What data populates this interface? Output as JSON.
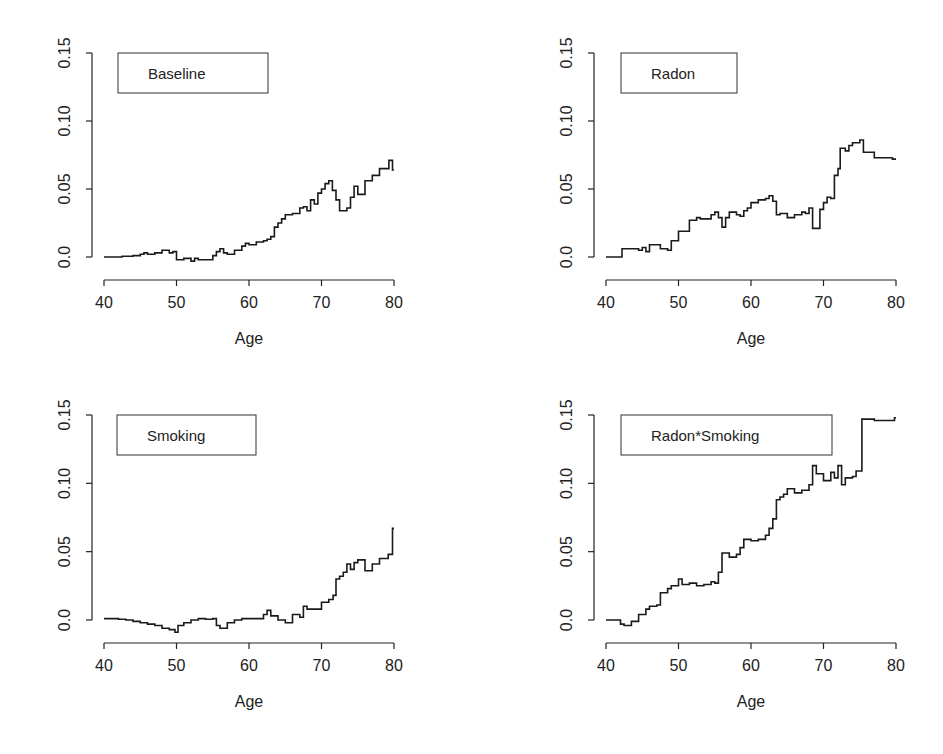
{
  "figure": {
    "panels_layout": "2x2",
    "x_label": "Age"
  },
  "chart_data": [
    {
      "type": "line",
      "step": true,
      "title": "Baseline",
      "legend": "Baseline",
      "xlabel": "Age",
      "ylabel": "",
      "xlim": [
        40,
        80
      ],
      "ylim": [
        -0.01,
        0.15
      ],
      "xticks": [
        40,
        50,
        60,
        70,
        80
      ],
      "xtick_labels": [
        "40",
        "50",
        "60",
        "70",
        "80"
      ],
      "yticks": [
        0.0,
        0.05,
        0.1,
        0.15
      ],
      "ytick_labels": [
        "0.0",
        "0.05",
        "0.10",
        "0.15"
      ],
      "grid": false,
      "legend_position": "top-left",
      "x": [
        40,
        42,
        42.5,
        44,
        45,
        45.5,
        46,
        47,
        48,
        49,
        49.5,
        50,
        50.5,
        51,
        52,
        52.5,
        53,
        54,
        55,
        55.5,
        56,
        56.5,
        57,
        58,
        59,
        59.5,
        60,
        61,
        62,
        62.5,
        63,
        63.5,
        64,
        64.5,
        65,
        66,
        67,
        67.5,
        68,
        68.5,
        69,
        69.5,
        70,
        70.5,
        71,
        71.5,
        72,
        72.5,
        73,
        73.5,
        74,
        74.5,
        75,
        76,
        77,
        78,
        79.3,
        79.8
      ],
      "y": [
        0.0,
        0.0,
        0.0005,
        0.001,
        0.002,
        0.003,
        0.002,
        0.003,
        0.005,
        0.003,
        0.004,
        -0.002,
        -0.002,
        -0.001,
        -0.003,
        -0.001,
        -0.002,
        -0.002,
        0.001,
        0.004,
        0.006,
        0.003,
        0.002,
        0.005,
        0.008,
        0.01,
        0.009,
        0.011,
        0.012,
        0.013,
        0.015,
        0.022,
        0.025,
        0.028,
        0.031,
        0.032,
        0.036,
        0.037,
        0.034,
        0.042,
        0.039,
        0.047,
        0.05,
        0.054,
        0.056,
        0.049,
        0.042,
        0.034,
        0.034,
        0.036,
        0.044,
        0.052,
        0.046,
        0.056,
        0.06,
        0.065,
        0.071,
        0.064
      ]
    },
    {
      "type": "line",
      "step": true,
      "title": "Radon",
      "legend": "Radon",
      "xlabel": "Age",
      "ylabel": "",
      "xlim": [
        40,
        80
      ],
      "ylim": [
        -0.01,
        0.15
      ],
      "xticks": [
        40,
        50,
        60,
        70,
        80
      ],
      "xtick_labels": [
        "40",
        "50",
        "60",
        "70",
        "80"
      ],
      "yticks": [
        0.0,
        0.05,
        0.1,
        0.15
      ],
      "ytick_labels": [
        "0.0",
        "0.05",
        "0.10",
        "0.15"
      ],
      "grid": false,
      "legend_position": "top-left",
      "x": [
        40,
        42.2,
        44.5,
        45,
        45.5,
        46,
        47.5,
        48.5,
        49,
        50,
        51.5,
        52.5,
        53,
        54.5,
        55,
        55.5,
        56,
        56.5,
        57,
        58,
        58.5,
        59,
        59.5,
        60,
        61,
        62,
        62.5,
        63,
        63.5,
        64,
        65,
        66,
        67,
        67.5,
        68,
        68.5,
        69,
        69.5,
        70,
        70.5,
        71,
        71.5,
        72,
        72.3,
        73,
        73.5,
        74,
        75,
        75.5,
        77,
        79.5
      ],
      "y": [
        0.0,
        0.006,
        0.005,
        0.007,
        0.004,
        0.009,
        0.006,
        0.005,
        0.012,
        0.019,
        0.027,
        0.029,
        0.028,
        0.031,
        0.033,
        0.029,
        0.022,
        0.029,
        0.033,
        0.031,
        0.03,
        0.034,
        0.036,
        0.04,
        0.042,
        0.043,
        0.045,
        0.041,
        0.031,
        0.032,
        0.029,
        0.031,
        0.033,
        0.032,
        0.036,
        0.021,
        0.021,
        0.035,
        0.04,
        0.044,
        0.043,
        0.06,
        0.065,
        0.08,
        0.078,
        0.082,
        0.084,
        0.086,
        0.077,
        0.073,
        0.072
      ]
    },
    {
      "type": "line",
      "step": true,
      "title": "Smoking",
      "legend": "Smoking",
      "xlabel": "Age",
      "ylabel": "",
      "xlim": [
        40,
        80
      ],
      "ylim": [
        -0.01,
        0.15
      ],
      "xticks": [
        40,
        50,
        60,
        70,
        80
      ],
      "xtick_labels": [
        "40",
        "50",
        "60",
        "70",
        "80"
      ],
      "yticks": [
        0.0,
        0.05,
        0.1,
        0.15
      ],
      "ytick_labels": [
        "0.0",
        "0.05",
        "0.10",
        "0.15"
      ],
      "grid": false,
      "legend_position": "top-left",
      "x": [
        40,
        42,
        43,
        44,
        45,
        46,
        47,
        48,
        49,
        49.8,
        50.2,
        51,
        52,
        53,
        54,
        55,
        55.5,
        56,
        57,
        58,
        59,
        60,
        61,
        62,
        62.5,
        63,
        64,
        65,
        66,
        67,
        67.5,
        68,
        69,
        70,
        71,
        71.6,
        72,
        72.5,
        73,
        73.5,
        74,
        74.5,
        75,
        76,
        77,
        78,
        79.2,
        79.8
      ],
      "y": [
        0.001,
        0.0005,
        0.0,
        -0.001,
        -0.002,
        -0.003,
        -0.004,
        -0.006,
        -0.007,
        -0.009,
        -0.004,
        -0.002,
        0.0,
        0.001,
        0.0005,
        0.001,
        -0.004,
        -0.006,
        -0.002,
        0.0,
        0.001,
        0.001,
        0.001,
        0.004,
        0.007,
        0.003,
        0.0,
        -0.002,
        0.004,
        0.002,
        0.01,
        0.008,
        0.008,
        0.013,
        0.015,
        0.018,
        0.03,
        0.032,
        0.035,
        0.041,
        0.037,
        0.042,
        0.044,
        0.036,
        0.041,
        0.045,
        0.048,
        0.067
      ]
    },
    {
      "type": "line",
      "step": true,
      "title": "Radon*Smoking",
      "legend": "Radon*Smoking",
      "xlabel": "Age",
      "ylabel": "",
      "xlim": [
        40,
        80
      ],
      "ylim": [
        -0.01,
        0.15
      ],
      "xticks": [
        40,
        50,
        60,
        70,
        80
      ],
      "xtick_labels": [
        "40",
        "50",
        "60",
        "70",
        "80"
      ],
      "yticks": [
        0.0,
        0.05,
        0.1,
        0.15
      ],
      "ytick_labels": [
        "0.0",
        "0.05",
        "0.10",
        "0.15"
      ],
      "grid": false,
      "legend_position": "top-left",
      "x": [
        40,
        42,
        42.5,
        43.5,
        44.5,
        45.5,
        46,
        47,
        47.5,
        48.5,
        49,
        50,
        50.5,
        51.5,
        52.5,
        53.5,
        54.5,
        55,
        55.5,
        56,
        57,
        58,
        58.5,
        59,
        60,
        61,
        62,
        62.5,
        63,
        63.5,
        64,
        64.5,
        65,
        66,
        67,
        68,
        68.5,
        69,
        70,
        71,
        71.5,
        72,
        72.5,
        73,
        74,
        74.5,
        75.3,
        77,
        79.2,
        79.8
      ],
      "y": [
        0.0,
        -0.003,
        -0.004,
        -0.001,
        0.004,
        0.008,
        0.01,
        0.011,
        0.02,
        0.023,
        0.025,
        0.03,
        0.026,
        0.027,
        0.025,
        0.026,
        0.028,
        0.027,
        0.035,
        0.049,
        0.046,
        0.048,
        0.053,
        0.059,
        0.058,
        0.059,
        0.062,
        0.067,
        0.074,
        0.088,
        0.09,
        0.092,
        0.096,
        0.093,
        0.095,
        0.099,
        0.113,
        0.107,
        0.102,
        0.108,
        0.104,
        0.113,
        0.099,
        0.104,
        0.105,
        0.109,
        0.147,
        0.146,
        0.146,
        0.148
      ]
    }
  ]
}
